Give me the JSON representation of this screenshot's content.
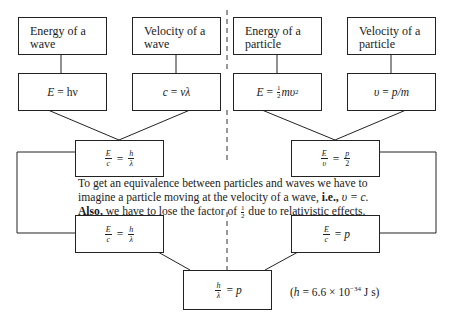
{
  "diagram": {
    "top_boxes": [
      {
        "label_line1": "Energy of a",
        "label_line2": "wave"
      },
      {
        "label_line1": "Velocity of a",
        "label_line2": "wave"
      },
      {
        "label_line1": "Energy of a",
        "label_line2": "particle"
      },
      {
        "label_line1": "Velocity of a",
        "label_line2": "particle"
      }
    ],
    "formula_boxes": [
      {
        "lhs": "E",
        "op": "=",
        "rhs": "hν"
      },
      {
        "lhs": "c",
        "op": "=",
        "rhs": "νλ"
      },
      {
        "lhs": "E",
        "op": "=",
        "coef_num": "1",
        "coef_den": "2",
        "rhs": "mυ",
        "rhs_sup": "2"
      },
      {
        "lhs": "υ",
        "op": "=",
        "rhs": "p/m"
      }
    ],
    "combined_boxes": [
      {
        "num1": "E",
        "den1": "c",
        "op": "=",
        "num2": "h",
        "den2": "λ"
      },
      {
        "num1": "E",
        "den1": "υ",
        "op": "=",
        "num2": "p",
        "den2": "2"
      }
    ],
    "note": {
      "line1": "To get an equivalence between particles and waves we have to",
      "line2_a": "imagine a particle moving at the velocity of a wave, ",
      "line2_b": "i.e.,",
      "line2_c": " υ = c.",
      "line3_a": "Also,",
      "line3_b": " we have to lose the factor of ",
      "line3_num": "1",
      "line3_den": "2",
      "line3_c": " due to relativistic effects."
    },
    "adjusted_boxes": [
      {
        "num1": "E",
        "den1": "c",
        "op": "=",
        "num2": "h",
        "den2": "λ"
      },
      {
        "num1": "E",
        "den1": "c",
        "op": "=",
        "rhs": "p"
      }
    ],
    "result_box": {
      "num": "h",
      "den": "λ",
      "op": "=",
      "rhs": "p"
    },
    "constant": {
      "prefix": "(",
      "symbol": "h",
      "eq": " = 6.6 × 10",
      "exp": "−34",
      "unit": " J  s)"
    },
    "colors": {
      "line": "#222222",
      "background": "#ffffff"
    }
  }
}
